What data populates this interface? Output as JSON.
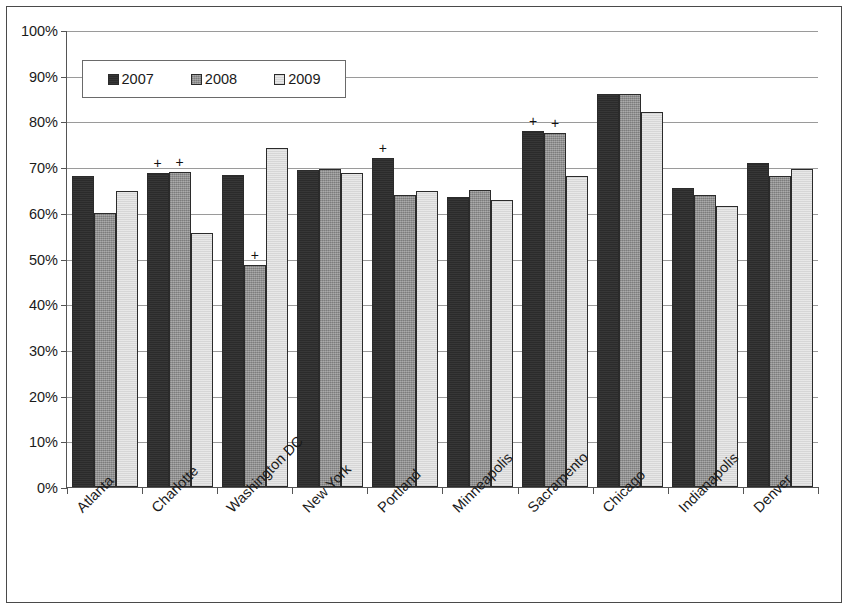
{
  "chart_data": {
    "type": "bar",
    "title": "",
    "subtitle": "",
    "xlabel": "",
    "ylabel": "",
    "ylim": [
      0,
      100
    ],
    "ytick_labels": [
      "100%",
      "90%",
      "80%",
      "70%",
      "60%",
      "50%",
      "40%",
      "30%",
      "20%",
      "10%",
      "0%"
    ],
    "ytick_values": [
      100,
      90,
      80,
      70,
      60,
      50,
      40,
      30,
      20,
      10,
      0
    ],
    "grid": true,
    "legend_position": "top-left-inside",
    "categories": [
      "Atlanta",
      "Charlotte",
      "Washington DC",
      "New York",
      "Portland",
      "Minneapolis",
      "Sacramento",
      "Chicago",
      "Indianapolis",
      "Denver"
    ],
    "series": [
      {
        "name": "2007",
        "color": "#2b2b2b",
        "values": [
          68.0,
          68.7,
          68.2,
          69.4,
          72.0,
          63.5,
          78.0,
          86.0,
          65.5,
          71.0
        ]
      },
      {
        "name": "2008",
        "color": "#8e8e8e",
        "values": [
          60.0,
          69.0,
          48.5,
          69.5,
          64.0,
          65.0,
          77.5,
          86.0,
          64.0,
          68.0
        ]
      },
      {
        "name": "2009",
        "color": "#e2e2e2",
        "values": [
          64.7,
          55.5,
          74.2,
          68.8,
          64.8,
          62.8,
          68.0,
          82.0,
          61.5,
          69.5
        ]
      }
    ],
    "annotations": [
      {
        "category": "Charlotte",
        "series": "2007",
        "marker": "+"
      },
      {
        "category": "Charlotte",
        "series": "2008",
        "marker": "+"
      },
      {
        "category": "Washington DC",
        "series": "2008",
        "marker": "+"
      },
      {
        "category": "Portland",
        "series": "2007",
        "marker": "+"
      },
      {
        "category": "Sacramento",
        "series": "2007",
        "marker": "+"
      },
      {
        "category": "Sacramento",
        "series": "2008",
        "marker": "+"
      }
    ]
  }
}
